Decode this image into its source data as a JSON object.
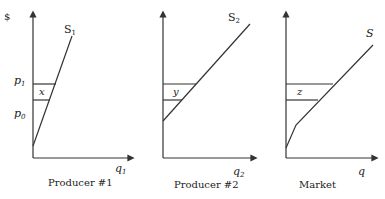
{
  "diagram": {
    "y_axis_symbol": "$",
    "price_labels": {
      "p1": "p",
      "p1_sub": "1",
      "p0": "p",
      "p0_sub": "0"
    },
    "panels": [
      {
        "id": "producer1",
        "caption": "Producer #1",
        "curve_label": "S",
        "curve_sub": "1",
        "x_axis_label": "q",
        "x_axis_sub": "1",
        "area_label": "x",
        "curve_type": "linear steep"
      },
      {
        "id": "producer2",
        "caption": "Producer #2",
        "curve_label": "S",
        "curve_sub": "2",
        "x_axis_label": "q",
        "x_axis_sub": "2",
        "area_label": "y",
        "curve_type": "linear flatter, higher intercept"
      },
      {
        "id": "market",
        "caption": "Market",
        "curve_label": "S",
        "curve_sub": "",
        "x_axis_label": "q",
        "x_axis_sub": "",
        "area_label": "z",
        "curve_type": "kinked horizontal sum"
      }
    ],
    "colors": {
      "line": "#333333",
      "background": "#ffffff"
    }
  }
}
